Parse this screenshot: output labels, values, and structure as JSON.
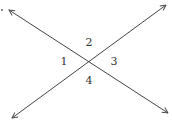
{
  "diagram": {
    "type": "intersecting-lines",
    "intersection": [
      89,
      61
    ],
    "lines": [
      {
        "name": "line-a",
        "from": [
          9,
          10
        ],
        "to": [
          168,
          113
        ]
      },
      {
        "name": "line-b",
        "from": [
          12,
          118
        ],
        "to": [
          166,
          5
        ]
      }
    ],
    "angles": [
      {
        "label": "1",
        "x": 64,
        "y": 65
      },
      {
        "label": "2",
        "x": 89,
        "y": 46
      },
      {
        "label": "3",
        "x": 114,
        "y": 65
      },
      {
        "label": "4",
        "x": 89,
        "y": 84
      }
    ],
    "stroke_color": "#444444"
  }
}
